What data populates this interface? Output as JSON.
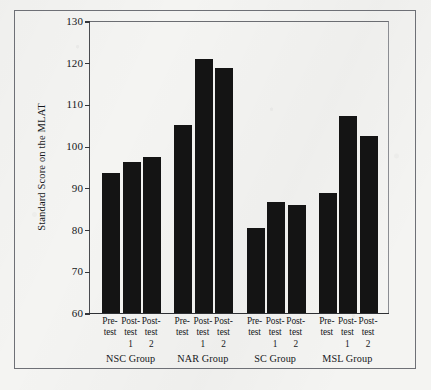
{
  "chart_data": {
    "type": "bar",
    "title": "",
    "xlabel": "",
    "ylabel": "Standard Score on the MLAT",
    "ylim": [
      60,
      130
    ],
    "yticks": [
      60,
      70,
      80,
      90,
      100,
      110,
      120,
      130
    ],
    "grid": false,
    "legend": null,
    "categories": [
      "Pre-test",
      "Post-test 1",
      "Post-test 2",
      "Pre-test",
      "Post-test 1",
      "Post-test 2",
      "Pre-test",
      "Post-test 1",
      "Post-test 2",
      "Pre-test",
      "Post-test 1",
      "Post-test 2"
    ],
    "values": [
      93.5,
      96.2,
      97.5,
      105.0,
      121.0,
      118.8,
      80.5,
      86.5,
      85.8,
      88.8,
      107.3,
      102.5
    ],
    "groups": [
      {
        "name": "NSC Group",
        "bars": [
          {
            "label_lines": [
              "Pre-",
              "test",
              ""
            ],
            "value": 93.5
          },
          {
            "label_lines": [
              "Post-",
              "test",
              "1"
            ],
            "value": 96.2
          },
          {
            "label_lines": [
              "Post-",
              "test",
              "2"
            ],
            "value": 97.5
          }
        ]
      },
      {
        "name": "NAR Group",
        "bars": [
          {
            "label_lines": [
              "Pre-",
              "test",
              ""
            ],
            "value": 105.0
          },
          {
            "label_lines": [
              "Post-",
              "test",
              "1"
            ],
            "value": 121.0
          },
          {
            "label_lines": [
              "Post-",
              "test",
              "2"
            ],
            "value": 118.8
          }
        ]
      },
      {
        "name": "SC Group",
        "bars": [
          {
            "label_lines": [
              "Pre-",
              "test",
              ""
            ],
            "value": 80.5
          },
          {
            "label_lines": [
              "Post-",
              "test",
              "1"
            ],
            "value": 86.5
          },
          {
            "label_lines": [
              "Post-",
              "test",
              "2"
            ],
            "value": 85.8
          }
        ]
      },
      {
        "name": "MSL Group",
        "bars": [
          {
            "label_lines": [
              "Pre-",
              "test",
              ""
            ],
            "value": 88.8
          },
          {
            "label_lines": [
              "Post-",
              "test",
              "1"
            ],
            "value": 107.3
          },
          {
            "label_lines": [
              "Post-",
              "test",
              "2"
            ],
            "value": 102.5
          }
        ]
      }
    ],
    "bar_color": "#141414",
    "background_color": "#f4f4f2",
    "axis_color": "#2e3034"
  }
}
